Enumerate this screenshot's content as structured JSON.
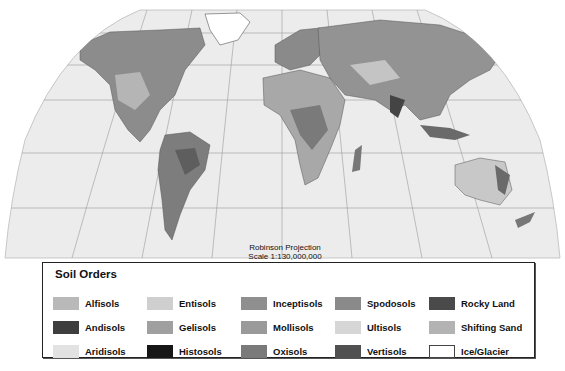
{
  "map": {
    "projection_label": "Robinson Projection",
    "scale_label": "Scale 1:130,000,000",
    "ocean_color": "#ececec",
    "graticule_color": "#9a9a9a"
  },
  "legend": {
    "title": "Soil Orders",
    "items": [
      {
        "label": "Alfisols",
        "color": "#b9b9b9"
      },
      {
        "label": "Entisols",
        "color": "#cfcfcf"
      },
      {
        "label": "Inceptisols",
        "color": "#8f8f8f"
      },
      {
        "label": "Spodosols",
        "color": "#8a8a8a"
      },
      {
        "label": "Rocky Land",
        "color": "#4a4a4a"
      },
      {
        "label": "Andisols",
        "color": "#3e3e3e"
      },
      {
        "label": "Gelisols",
        "color": "#a0a0a0"
      },
      {
        "label": "Mollisols",
        "color": "#9a9a9a"
      },
      {
        "label": "Ultisols",
        "color": "#d6d6d6"
      },
      {
        "label": "Shifting Sand",
        "color": "#b3b3b3"
      },
      {
        "label": "Aridisols",
        "color": "#e2e2e2"
      },
      {
        "label": "Histosols",
        "color": "#161616"
      },
      {
        "label": "Oxisols",
        "color": "#7a7a7a"
      },
      {
        "label": "Vertisols",
        "color": "#505050"
      },
      {
        "label": "Ice/Glacier",
        "color": "#ffffff"
      }
    ]
  }
}
